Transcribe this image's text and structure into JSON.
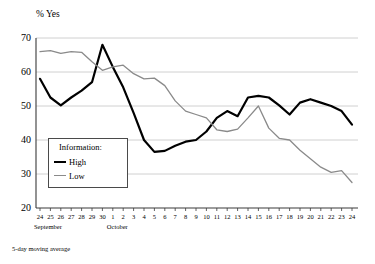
{
  "chart_data": {
    "type": "line",
    "title": "",
    "ylabel": "% Yes",
    "xlabel": "",
    "ylim": [
      20,
      70
    ],
    "yticks": [
      20,
      30,
      40,
      50,
      60,
      70
    ],
    "grid": true,
    "legend_position": "inside-left",
    "legend_title": "Information:",
    "footnote": "5-day moving average",
    "x": [
      "24",
      "25",
      "26",
      "27",
      "28",
      "29",
      "30",
      "1",
      "2",
      "3",
      "4",
      "5",
      "6",
      "7",
      "8",
      "9",
      "10",
      "11",
      "12",
      "13",
      "14",
      "15",
      "16",
      "17",
      "18",
      "19",
      "20",
      "21",
      "22",
      "23",
      "24"
    ],
    "month_labels": [
      {
        "text": "September",
        "at_index": 0
      },
      {
        "text": "October",
        "at_index": 7
      }
    ],
    "series": [
      {
        "name": "High",
        "color": "#000000",
        "width": 2.2,
        "values": [
          58.0,
          52.5,
          50.2,
          52.5,
          54.5,
          57.0,
          68.0,
          61.5,
          55.5,
          48.0,
          40.0,
          36.5,
          36.8,
          38.3,
          39.5,
          40.0,
          42.5,
          46.5,
          48.5,
          47.0,
          52.5,
          53.0,
          52.5,
          50.2,
          47.5,
          51.0,
          52.0,
          51.0,
          50.0,
          48.5,
          44.5
        ]
      },
      {
        "name": "Low",
        "color": "#8a8a8a",
        "width": 1.3,
        "values": [
          66.0,
          66.3,
          65.5,
          66.0,
          65.8,
          63.0,
          60.5,
          61.5,
          62.0,
          59.5,
          58.0,
          58.2,
          56.0,
          51.5,
          48.5,
          47.5,
          46.5,
          43.0,
          42.5,
          43.2,
          46.5,
          50.0,
          43.5,
          40.5,
          40.0,
          37.0,
          34.5,
          32.0,
          30.5,
          31.0,
          27.5
        ]
      }
    ],
    "axis_geometry": {
      "plot_left": 36,
      "plot_right": 358,
      "plot_top": 38,
      "plot_bottom": 208,
      "first_tick_x": 40,
      "last_tick_x": 352
    }
  }
}
